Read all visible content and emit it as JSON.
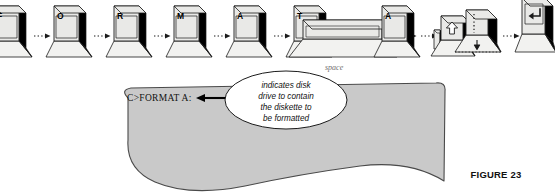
{
  "figure": {
    "caption": "FIGURE 23",
    "spacebar_caption": "space"
  },
  "keystroke_sequence": {
    "connector": "dotted-arrow",
    "keys": [
      {
        "name": "key-f",
        "label": "F",
        "type": "letter",
        "icon": ""
      },
      {
        "name": "key-o",
        "label": "O",
        "type": "letter",
        "icon": ""
      },
      {
        "name": "key-r",
        "label": "R",
        "type": "letter",
        "icon": ""
      },
      {
        "name": "key-m",
        "label": "M",
        "type": "letter",
        "icon": ""
      },
      {
        "name": "key-a-1",
        "label": "A",
        "type": "letter",
        "icon": ""
      },
      {
        "name": "key-t",
        "label": "T",
        "type": "letter",
        "icon": ""
      },
      {
        "name": "key-space",
        "label": "",
        "type": "spacebar",
        "icon": ""
      },
      {
        "name": "key-a-2",
        "label": "A",
        "type": "letter",
        "icon": ""
      },
      {
        "name": "key-shift",
        "label": "",
        "type": "shift",
        "icon": "shift-up-arrow-icon"
      },
      {
        "name": "key-colon",
        "label": ":",
        "type": "colon",
        "icon": "down-arrow-icon"
      },
      {
        "name": "key-enter",
        "label": "",
        "type": "enter",
        "icon": "return-arrow-icon"
      }
    ]
  },
  "screen": {
    "prompt": "C>FORMAT  A:",
    "callout": {
      "lines": [
        "indicates disk",
        "drive to contain",
        "the diskette to",
        "be formatted"
      ],
      "pointer": "left-arrow"
    }
  },
  "colors": {
    "keycap_top": "#e9e9e7",
    "keycap_side": "#000000",
    "keycap_base": "#f2f2f0",
    "outline": "#1b1b1b",
    "screen_fill": "#c9c9c9",
    "screen_outline": "#4a4a4a",
    "callout_fill": "#ffffff",
    "caption": "#111111"
  }
}
